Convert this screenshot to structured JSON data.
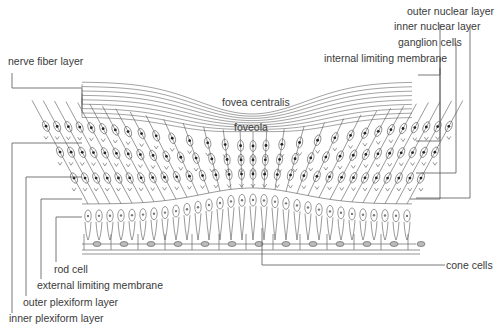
{
  "diagram": {
    "labels": {
      "nerve_fiber_layer": "nerve fiber layer",
      "fovea_centralis": "fovea centralis",
      "foveola": "foveola",
      "outer_nuclear_layer": "outer nuclear layer",
      "inner_nuclear_layer": "inner nuclear layer",
      "ganglion_cells": "ganglion cells",
      "internal_limiting_membrane": "internal limiting membrane",
      "rod_cell": "rod cell",
      "external_limiting_membrane": "external limiting membrane",
      "outer_plexiform_layer": "outer plexiform layer",
      "inner_plexiform_layer": "inner plexiform layer",
      "cone_cells": "cone cells"
    },
    "colors": {
      "line": "#555555",
      "text": "#3a3a3a",
      "nucleus": "#222222"
    }
  }
}
